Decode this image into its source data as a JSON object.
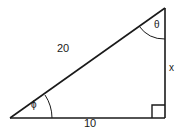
{
  "figure": {
    "type": "right-triangle-diagram",
    "background_color": "#ffffff",
    "stroke_color": "#1a1a1a",
    "labels": {
      "hypotenuse": "20",
      "base": "10",
      "vertical_side": "x",
      "angle_top_right": "θ",
      "angle_bottom_left": "ϕ"
    },
    "markers": {
      "right_angle": "right-angle-square",
      "angle_arc_theta": "arc",
      "angle_arc_phi": "arc"
    },
    "geometry": {
      "vertex_left": [
        10,
        118
      ],
      "vertex_bottom_right": [
        165,
        118
      ],
      "vertex_top_right": [
        165,
        8
      ]
    }
  }
}
